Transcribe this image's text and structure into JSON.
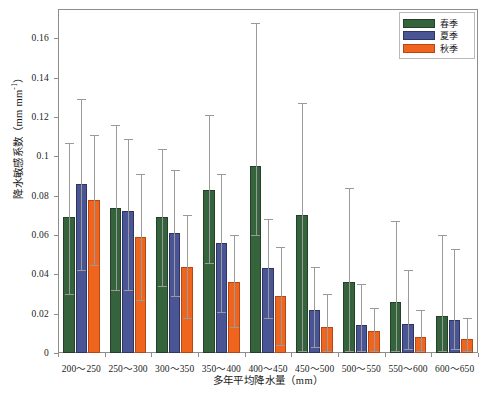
{
  "chart_data": {
    "type": "bar",
    "title": "",
    "xlabel": "多年平均降水量（mm）",
    "ylabel_text": "降水敏感系数（mm mm",
    "ylabel_sup": "-1",
    "ylabel_tail": "）",
    "ylabel_full": "降水敏感系数（mm mm-1）",
    "categories": [
      "200～250",
      "250～300",
      "300～350",
      "350～400",
      "400～450",
      "450～500",
      "500～550",
      "550～600",
      "600～650"
    ],
    "ylim": [
      0,
      0.175
    ],
    "yticks": [
      0,
      0.02,
      0.04,
      0.06,
      0.08,
      0.1,
      0.12,
      0.14,
      0.16
    ],
    "ytick_labels": [
      "0",
      "0.02",
      "0.04",
      "0.06",
      "0.08",
      "0.1",
      "0.12",
      "0.14",
      "0.16"
    ],
    "grid": false,
    "legend_position": "top-right",
    "errorbars": true,
    "series": [
      {
        "name": "春季",
        "color": "#35633c",
        "values": [
          0.069,
          0.074,
          0.069,
          0.083,
          0.095,
          0.07,
          0.036,
          0.026,
          0.019
        ],
        "err_low": [
          0.03,
          0.032,
          0.034,
          0.046,
          0.06,
          0.001,
          0.001,
          0.001,
          0.001
        ],
        "err_high": [
          0.107,
          0.116,
          0.104,
          0.121,
          0.168,
          0.127,
          0.084,
          0.067,
          0.06
        ]
      },
      {
        "name": "夏季",
        "color": "#4a5596",
        "values": [
          0.086,
          0.072,
          0.061,
          0.056,
          0.043,
          0.022,
          0.014,
          0.015,
          0.017
        ],
        "err_low": [
          0.042,
          0.032,
          0.029,
          0.021,
          0.018,
          0.003,
          0.001,
          0.002,
          0.002
        ],
        "err_high": [
          0.129,
          0.109,
          0.093,
          0.091,
          0.068,
          0.044,
          0.035,
          0.042,
          0.053
        ]
      },
      {
        "name": "秋季",
        "color": "#f0651e",
        "values": [
          0.078,
          0.059,
          0.044,
          0.036,
          0.029,
          0.013,
          0.011,
          0.008,
          0.007
        ],
        "err_low": [
          0.045,
          0.027,
          0.018,
          0.013,
          0.004,
          0.001,
          0.001,
          0.001,
          0.001
        ],
        "err_high": [
          0.111,
          0.091,
          0.07,
          0.06,
          0.054,
          0.03,
          0.023,
          0.022,
          0.018
        ]
      }
    ]
  },
  "legend": {
    "items": [
      {
        "label": "春季",
        "color": "#35633c"
      },
      {
        "label": "夏季",
        "color": "#4a5596"
      },
      {
        "label": "秋季",
        "color": "#f0651e"
      }
    ]
  }
}
